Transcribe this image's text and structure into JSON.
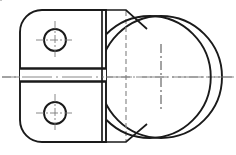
{
  "document": {
    "type": "engineering-drawing",
    "title": "Orthographic View - Bracket with Circular Boss",
    "projection": "two-view orthographic",
    "background_color": "#ffffff",
    "width_px": 236,
    "height_px": 155
  },
  "style": {
    "visible_edge_color": "#1a1a1a",
    "visible_edge_width": "1.6",
    "thick_edge_width": "2.4",
    "hidden_line_color": "#8c8c8c",
    "hidden_line_width": "1.2",
    "hidden_dash_pattern": "5,3",
    "center_line_color": "#7a7a7a",
    "center_line_width": "0.9",
    "center_dash_pattern": "9,3,2,3"
  },
  "geometry": {
    "body_plate": {
      "name": "left-body-plate",
      "description": "Rounded rectangular plate, front view",
      "left": 20,
      "right": 106,
      "top": 10,
      "bottom": 142,
      "corner_radius_left": 22,
      "path": "M 42 10 L 106 10 L 106 142 L 42 142 A 22 22 0 0 1 20 120 L 20 32 A 22 22 0 0 1 42 10 Z"
    },
    "slot": {
      "name": "horizontal-slot",
      "description": "Split groove across plate",
      "top_y": 68,
      "bottom_y": 82,
      "left": 20,
      "right": 106
    },
    "holes": [
      {
        "name": "upper-hole",
        "cx": 55,
        "cy": 40,
        "r": 11
      },
      {
        "name": "lower-hole",
        "cx": 55,
        "cy": 113,
        "r": 11
      }
    ],
    "boss_circle": {
      "name": "circular-boss",
      "cx": 161,
      "cy": 77,
      "r": 61
    },
    "inner_vertical_edges": [
      {
        "name": "plate-right-edge",
        "x": 106,
        "y1": 10,
        "y2": 142
      },
      {
        "name": "plate-inner-edge",
        "x": 102,
        "y1": 10,
        "y2": 142
      }
    ],
    "hidden_line": {
      "name": "hidden-bore-edge",
      "x": 126,
      "y1": 10,
      "y2": 142
    },
    "chamfers": [
      {
        "name": "top-chamfer",
        "path": "M 106 10 L 126 10 L 147 29"
      },
      {
        "name": "bottom-chamfer",
        "path": "M 106 142 L 126 142 L 147 124"
      }
    ],
    "center_lines": [
      {
        "name": "main-horizontal-centerline",
        "x1": 2,
        "y1": 77,
        "x2": 234,
        "y2": 77
      },
      {
        "name": "boss-vertical-centerline",
        "x1": 161,
        "y1": 44,
        "x2": 161,
        "y2": 110
      },
      {
        "name": "upper-hole-horizontal-centerline",
        "x1": 36,
        "y1": 40,
        "x2": 74,
        "y2": 40
      },
      {
        "name": "upper-hole-vertical-centerline",
        "x1": 55,
        "y1": 21,
        "x2": 55,
        "y2": 59
      },
      {
        "name": "lower-hole-horizontal-centerline",
        "x1": 36,
        "y1": 113,
        "x2": 74,
        "y2": 113
      },
      {
        "name": "lower-hole-vertical-centerline",
        "x1": 55,
        "y1": 94,
        "x2": 55,
        "y2": 132
      }
    ]
  }
}
